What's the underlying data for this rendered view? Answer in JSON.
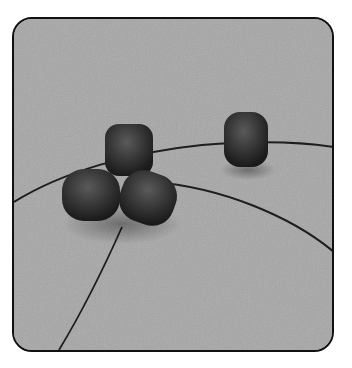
{
  "image": {
    "description": "Photograph of four dark matte beads threaded on thin wire on a grey textured surface, inside a rounded black frame",
    "frame_color": "#111111",
    "background_color": "#a6a6a6",
    "bead_color": "#2e2e2e",
    "wire_color": "#1a1a1a",
    "beads": [
      {
        "name": "top-center-bead",
        "cx": 127,
        "cy": 148
      },
      {
        "name": "left-bead",
        "cx": 90,
        "cy": 192
      },
      {
        "name": "right-front-bead",
        "cx": 145,
        "cy": 198
      },
      {
        "name": "single-right-bead",
        "cx": 243,
        "cy": 137
      }
    ]
  }
}
